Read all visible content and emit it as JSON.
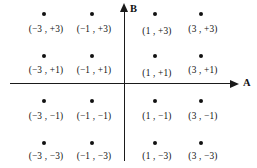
{
  "figure": {
    "background_color": "#ffffff",
    "ink_color": "#111111"
  },
  "chart_data": {
    "type": "scatter",
    "title": "",
    "subtitle": "",
    "xlabel": "A",
    "ylabel": "B",
    "grid": false,
    "legend": null,
    "axes": {
      "x_axis_label": "A",
      "y_axis_label": "B",
      "x_arrow": true,
      "y_arrow": true,
      "xlim": [
        -4.4,
        4.4
      ],
      "ylim": [
        -4.4,
        4.4
      ],
      "tick_labels": [],
      "origin_shown": true
    },
    "annotations": [
      "(-3 , +3)",
      "(-1 , +3)",
      "(1 , +3)",
      "(3 , +3)",
      "(-3 , +1)",
      "(-1 , +1)",
      "(1 , +1)",
      "(3 , +1)",
      "(-3 , -1)",
      "(-1 , -1)",
      "(1 , -1)",
      "(3 , -1)",
      "(-3 , -3)",
      "(-1 , -3)",
      "(1 , -3)",
      "(3 , -3)"
    ],
    "x": [
      -3,
      -1,
      1,
      3,
      -3,
      -1,
      1,
      3,
      -3,
      -1,
      1,
      3,
      -3,
      -1,
      1,
      3
    ],
    "y": [
      3,
      3,
      3,
      3,
      1,
      1,
      1,
      1,
      -1,
      -1,
      -1,
      -1,
      -3,
      -3,
      -3,
      -3
    ],
    "points": [
      {
        "label": "(−3 , +3)",
        "x": -3,
        "y": 3,
        "px": 44,
        "py": 14,
        "label_x": 46,
        "label_y": 25
      },
      {
        "label": "(−1 , +3)",
        "x": -1,
        "y": 3,
        "px": 92,
        "py": 14,
        "label_x": 94,
        "label_y": 25
      },
      {
        "label": "(1 , +3)",
        "x": 1,
        "y": 3,
        "px": 155,
        "py": 14,
        "label_x": 157,
        "label_y": 27
      },
      {
        "label": "(3 , +3)",
        "x": 3,
        "y": 3,
        "px": 201,
        "py": 14,
        "label_x": 203,
        "label_y": 25
      },
      {
        "label": "(−3 , +1)",
        "x": -3,
        "y": 1,
        "px": 44,
        "py": 56,
        "label_x": 46,
        "label_y": 66
      },
      {
        "label": "(−1 , +1)",
        "x": -1,
        "y": 1,
        "px": 92,
        "py": 56,
        "label_x": 94,
        "label_y": 66
      },
      {
        "label": "(1 , +1)",
        "x": 1,
        "y": 1,
        "px": 155,
        "py": 56,
        "label_x": 157,
        "label_y": 69
      },
      {
        "label": "(3 , +1)",
        "x": 3,
        "y": 1,
        "px": 201,
        "py": 56,
        "label_x": 203,
        "label_y": 66
      },
      {
        "label": "(−3 , −1)",
        "x": -3,
        "y": -1,
        "px": 44,
        "py": 101,
        "label_x": 46,
        "label_y": 112
      },
      {
        "label": "(−1 , −1)",
        "x": -1,
        "y": -1,
        "px": 92,
        "py": 101,
        "label_x": 94,
        "label_y": 112
      },
      {
        "label": "(1 , −1)",
        "x": 1,
        "y": -1,
        "px": 155,
        "py": 101,
        "label_x": 157,
        "label_y": 112
      },
      {
        "label": "(3 , −1)",
        "x": 3,
        "y": -1,
        "px": 201,
        "py": 101,
        "label_x": 203,
        "label_y": 112
      },
      {
        "label": "(−3 , −3)",
        "x": -3,
        "y": -3,
        "px": 44,
        "py": 143,
        "label_x": 46,
        "label_y": 152
      },
      {
        "label": "(−1 , −3)",
        "x": -1,
        "y": -3,
        "px": 92,
        "py": 143,
        "label_x": 94,
        "label_y": 152
      },
      {
        "label": "(1 , −3)",
        "x": 1,
        "y": -3,
        "px": 155,
        "py": 143,
        "label_x": 157,
        "label_y": 152
      },
      {
        "label": "(3 , −3)",
        "x": 3,
        "y": -3,
        "px": 201,
        "py": 143,
        "label_x": 203,
        "label_y": 152
      }
    ]
  }
}
